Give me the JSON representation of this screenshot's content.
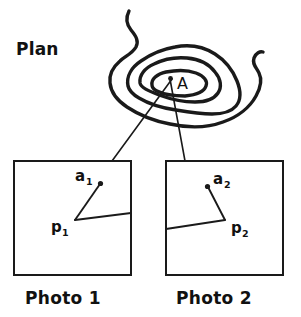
{
  "figure": {
    "plan_label": "Plan",
    "area_label": "A",
    "photos": [
      {
        "caption": "Photo 1",
        "image_point_label": "a",
        "image_point_subscript": "1",
        "principal_point_label": "p",
        "principal_point_subscript": "1"
      },
      {
        "caption": "Photo 2",
        "image_point_label": "a",
        "image_point_subscript": "2",
        "principal_point_label": "p",
        "principal_point_subscript": "2"
      }
    ],
    "colors": {
      "background": "#ffffff",
      "ink": "#1a1a1a",
      "text": "#111111"
    }
  }
}
